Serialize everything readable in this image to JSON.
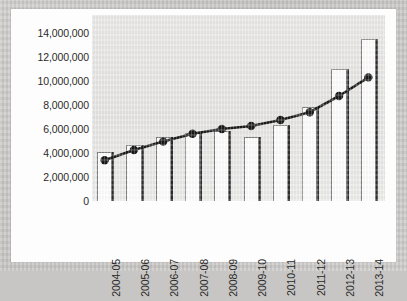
{
  "chart_data": {
    "type": "bar",
    "title": "",
    "subtitle": "",
    "xlabel": "",
    "ylabel": "",
    "categories": [
      "2004-05",
      "2005-06",
      "2006-07",
      "2007-08",
      "2008-09",
      "2009-10",
      "2010-11",
      "2011-12",
      "2012-13",
      "2013-14"
    ],
    "ytick_labels": [
      "14,000,000",
      "12,000,000",
      "10,000,000",
      "8,000,000",
      "6,000,000",
      "4,000,000",
      "2,000,000",
      "0"
    ],
    "ytick_values": [
      14000000,
      12000000,
      10000000,
      8000000,
      6000000,
      4000000,
      2000000,
      0
    ],
    "ylim": [
      0,
      15500000
    ],
    "grid": false,
    "legend": "none",
    "series": [
      {
        "name": "bars",
        "type": "bar",
        "color": "#fefefe",
        "edge_color": "#2e2e2e",
        "values": [
          4100000,
          4700000,
          5300000,
          5700000,
          5800000,
          5300000,
          6300000,
          7800000,
          11000000,
          13500000
        ]
      },
      {
        "name": "line",
        "type": "line",
        "color": "#1a1a1a",
        "marker": "circle",
        "values": [
          3400000,
          4250000,
          4950000,
          5600000,
          6000000,
          6250000,
          6750000,
          7400000,
          8750000,
          10300000
        ]
      }
    ]
  },
  "axes": {
    "y_min_label": "0",
    "y_max_label": "14,000,000"
  }
}
